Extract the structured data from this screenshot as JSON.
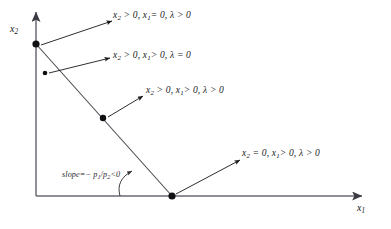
{
  "figure": {
    "type": "diagram",
    "kind": "kkt-corner-solution-cases",
    "background_color": "#ffffff",
    "ink_color": "#17171c",
    "axes": {
      "x_label": "x",
      "x_label_sub": "1",
      "y_label": "x",
      "y_label_sub": "2",
      "x_axis_name": "horizontal-axis",
      "y_axis_name": "vertical-axis"
    },
    "budget_line": {
      "name": "budget-line",
      "slope_annotation_prefix": "slope=",
      "slope_annotation": "− p",
      "slope_sub_1": "1",
      "slope_mid": "/p",
      "slope_sub_2": "2",
      "slope_suffix": "<0",
      "slope_full_text": "slope=− p1/p2<0"
    },
    "cases": [
      {
        "id": "case-1",
        "name": "case-label-x1-zero",
        "text": "x",
        "sub_a": "2",
        "part_a": " > 0, ",
        "text_b": "x",
        "sub_b": "1",
        "part_b": "= 0, ",
        "lambda": "λ",
        "part_c": " > 0",
        "full_text": "x2 > 0, x1= 0, λ > 0"
      },
      {
        "id": "case-2",
        "name": "case-label-lambda-zero",
        "text": "x",
        "sub_a": "2",
        "part_a": " > 0, ",
        "text_b": "x",
        "sub_b": "1",
        "part_b": "> 0, ",
        "lambda": "λ",
        "part_c": " = 0",
        "full_text": "x2 > 0, x1> 0, λ = 0"
      },
      {
        "id": "case-3",
        "name": "case-label-interior",
        "text": "x",
        "sub_a": "2",
        "part_a": " > 0, ",
        "text_b": "x",
        "sub_b": "1",
        "part_b": "> 0, ",
        "lambda": "λ",
        "part_c": " > 0",
        "full_text": "x2 > 0, x1> 0, λ > 0"
      },
      {
        "id": "case-4",
        "name": "case-label-x2-zero",
        "text": "x",
        "sub_a": "2",
        "part_a": " = 0, ",
        "text_b": "x",
        "sub_b": "1",
        "part_b": "> 0, ",
        "lambda": "λ",
        "part_c": " > 0",
        "full_text": "x2 = 0, x1> 0, λ > 0"
      }
    ],
    "points": [
      {
        "name": "point-on-y-axis",
        "x": 36,
        "y": 44,
        "radius": 3.6
      },
      {
        "name": "point-interior",
        "x": 45,
        "y": 73,
        "radius": 2.3
      },
      {
        "name": "point-on-line",
        "x": 103,
        "y": 118,
        "radius": 3.2
      },
      {
        "name": "point-on-x-axis",
        "x": 172,
        "y": 196,
        "radius": 3.6
      }
    ],
    "arrows": [
      {
        "name": "arrow-to-case-1",
        "x1": 41,
        "y1": 45,
        "x2": 112,
        "y2": 21
      },
      {
        "name": "arrow-to-case-2",
        "x1": 49,
        "y1": 73,
        "x2": 110,
        "y2": 58
      },
      {
        "name": "arrow-to-case-3",
        "x1": 108,
        "y1": 117,
        "x2": 143,
        "y2": 96
      },
      {
        "name": "arrow-to-case-4",
        "x1": 176,
        "y1": 194,
        "x2": 240,
        "y2": 160
      }
    ],
    "slope_pointer": {
      "name": "slope-pointer-curved-arrow",
      "path": "M 120 196 C 118 186 122 178 133 171",
      "tip_x": 133,
      "tip_y": 171
    }
  }
}
